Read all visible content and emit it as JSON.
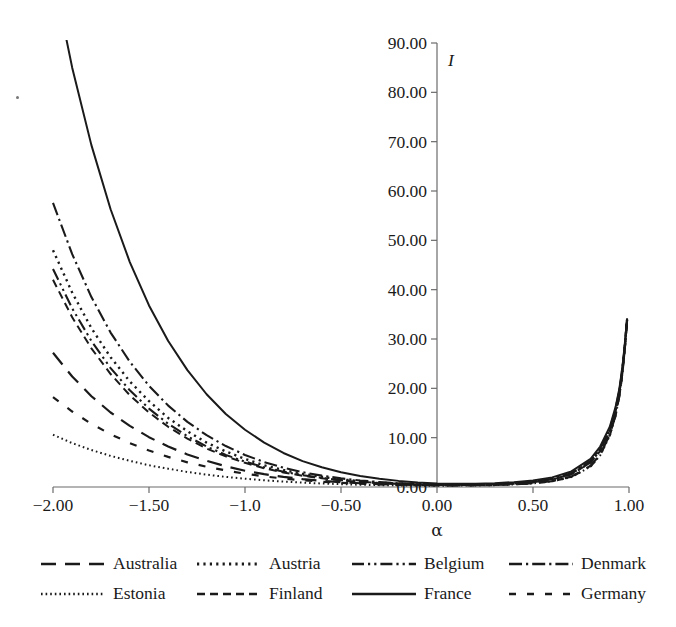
{
  "chart_data": {
    "type": "line",
    "title": "",
    "xlabel": "α",
    "ylabel": "I",
    "xlim": [
      -2.0,
      1.0
    ],
    "ylim": [
      0.0,
      90.0
    ],
    "grid": false,
    "legend_position": "bottom",
    "x_ticks": [
      {
        "value": -2.0,
        "label": "−2.00"
      },
      {
        "value": -1.5,
        "label": "−1.50"
      },
      {
        "value": -1.0,
        "label": "−1.0"
      },
      {
        "value": -0.5,
        "label": "−0.50"
      },
      {
        "value": 0.0,
        "label": "0.00"
      },
      {
        "value": 0.5,
        "label": "0.50"
      },
      {
        "value": 1.0,
        "label": "1.00"
      }
    ],
    "y_ticks": [
      {
        "value": 90.0,
        "label": "90.00"
      },
      {
        "value": 80.0,
        "label": "80.00"
      },
      {
        "value": 70.0,
        "label": "70.00"
      },
      {
        "value": 60.0,
        "label": "60.00"
      },
      {
        "value": 50.0,
        "label": "50.00"
      },
      {
        "value": 40.0,
        "label": "40.00"
      },
      {
        "value": 30.0,
        "label": "30.00"
      },
      {
        "value": 20.0,
        "label": "20.00"
      },
      {
        "value": 10.0,
        "label": "10.00"
      },
      {
        "value": 0.0,
        "label": "0.00"
      }
    ],
    "x": [
      -2.0,
      -1.9,
      -1.8,
      -1.7,
      -1.6,
      -1.5,
      -1.4,
      -1.3,
      -1.2,
      -1.1,
      -1.0,
      -0.9,
      -0.8,
      -0.7,
      -0.6,
      -0.5,
      -0.4,
      -0.3,
      -0.2,
      -0.1,
      0.0,
      0.1,
      0.2,
      0.3,
      0.4,
      0.5,
      0.6,
      0.7,
      0.8,
      0.85,
      0.9,
      0.93,
      0.95,
      0.96,
      0.97,
      0.98,
      0.985,
      0.99
    ],
    "series": [
      {
        "name": "Australia",
        "dash": "long-dash",
        "color": "#1a1a1a",
        "values": [
          27.2,
          22.4,
          18.4,
          15.1,
          12.4,
          10.1,
          8.2,
          6.6,
          5.3,
          4.2,
          3.3,
          2.6,
          2.05,
          1.6,
          1.25,
          0.98,
          0.76,
          0.6,
          0.47,
          0.39,
          0.35,
          0.34,
          0.36,
          0.42,
          0.55,
          0.78,
          1.2,
          2.1,
          4.3,
          6.6,
          10.6,
          14.6,
          18.6,
          21.4,
          24.8,
          29.0,
          31.4,
          33.8
        ]
      },
      {
        "name": "Austria",
        "dash": "dot",
        "color": "#1a1a1a",
        "values": [
          48.0,
          39.4,
          32.2,
          26.3,
          21.4,
          17.4,
          14.0,
          11.3,
          9.0,
          7.2,
          5.7,
          4.4,
          3.45,
          2.65,
          2.05,
          1.55,
          1.18,
          0.9,
          0.68,
          0.54,
          0.45,
          0.43,
          0.46,
          0.55,
          0.72,
          1.02,
          1.6,
          2.7,
          5.2,
          7.6,
          11.6,
          15.6,
          19.4,
          22.1,
          25.3,
          29.3,
          31.6,
          33.9
        ]
      },
      {
        "name": "Belgium",
        "dash": "dash-dot-dot",
        "color": "#1a1a1a",
        "values": [
          44.2,
          36.2,
          29.6,
          24.1,
          19.6,
          15.9,
          12.8,
          10.3,
          8.2,
          6.5,
          5.15,
          4.0,
          3.1,
          2.4,
          1.85,
          1.4,
          1.07,
          0.82,
          0.63,
          0.5,
          0.43,
          0.41,
          0.44,
          0.53,
          0.69,
          0.99,
          1.55,
          2.6,
          5.0,
          7.4,
          11.4,
          15.4,
          19.2,
          22.0,
          25.2,
          29.2,
          31.5,
          33.9
        ]
      },
      {
        "name": "Denmark",
        "dash": "dash-dot",
        "color": "#1a1a1a",
        "values": [
          57.6,
          47.2,
          38.5,
          31.3,
          25.4,
          20.5,
          16.5,
          13.2,
          10.5,
          8.3,
          6.5,
          5.05,
          3.9,
          3.0,
          2.3,
          1.75,
          1.32,
          1.0,
          0.76,
          0.59,
          0.49,
          0.46,
          0.49,
          0.58,
          0.76,
          1.07,
          1.67,
          2.8,
          5.3,
          7.8,
          11.8,
          15.8,
          19.6,
          22.3,
          25.4,
          29.4,
          31.7,
          34.0
        ]
      },
      {
        "name": "Estonia",
        "dash": "fine-dot",
        "color": "#1a1a1a",
        "values": [
          10.6,
          8.9,
          7.5,
          6.3,
          5.3,
          4.4,
          3.7,
          3.05,
          2.5,
          2.05,
          1.68,
          1.36,
          1.1,
          0.88,
          0.71,
          0.57,
          0.46,
          0.38,
          0.32,
          0.28,
          0.27,
          0.28,
          0.31,
          0.38,
          0.51,
          0.73,
          1.15,
          2.0,
          4.15,
          6.4,
          10.4,
          14.4,
          18.4,
          21.2,
          24.6,
          28.8,
          31.3,
          33.7
        ]
      },
      {
        "name": "Finland",
        "dash": "medium-dash",
        "color": "#1a1a1a",
        "values": [
          42.0,
          34.4,
          28.1,
          22.9,
          18.6,
          15.1,
          12.2,
          9.8,
          7.8,
          6.2,
          4.9,
          3.8,
          2.95,
          2.28,
          1.76,
          1.34,
          1.02,
          0.78,
          0.6,
          0.48,
          0.42,
          0.4,
          0.43,
          0.52,
          0.68,
          0.97,
          1.52,
          2.55,
          4.95,
          7.3,
          11.3,
          15.3,
          19.1,
          21.9,
          25.1,
          29.1,
          31.5,
          33.8
        ]
      },
      {
        "name": "France",
        "dash": "solid",
        "color": "#1a1a1a",
        "values": [
          104.0,
          85.0,
          69.3,
          56.3,
          45.6,
          36.8,
          29.6,
          23.7,
          18.8,
          14.8,
          11.6,
          9.0,
          6.9,
          5.25,
          4.0,
          3.0,
          2.25,
          1.67,
          1.24,
          0.93,
          0.73,
          0.66,
          0.68,
          0.78,
          0.98,
          1.32,
          1.95,
          3.15,
          5.7,
          8.2,
          12.2,
          16.2,
          20.0,
          22.7,
          25.8,
          29.8,
          32.0,
          34.2
        ]
      },
      {
        "name": "Germany",
        "dash": "spaced-dash",
        "color": "#1a1a1a",
        "values": [
          18.2,
          15.3,
          12.8,
          10.7,
          8.9,
          7.4,
          6.1,
          5.0,
          4.1,
          3.35,
          2.7,
          2.15,
          1.72,
          1.36,
          1.07,
          0.85,
          0.67,
          0.53,
          0.43,
          0.35,
          0.32,
          0.32,
          0.34,
          0.4,
          0.53,
          0.75,
          1.17,
          2.05,
          4.2,
          6.5,
          10.5,
          14.5,
          18.5,
          21.3,
          24.7,
          28.9,
          31.35,
          33.75
        ]
      }
    ]
  },
  "legend": {
    "rows": [
      [
        {
          "label": "Australia",
          "sample": "long-dash"
        },
        {
          "label": "Austria",
          "sample": "dot"
        },
        {
          "label": "Belgium",
          "sample": "dash-dot-dot"
        },
        {
          "label": "Denmark",
          "sample": "dash-dot"
        }
      ],
      [
        {
          "label": "Estonia",
          "sample": "fine-dot"
        },
        {
          "label": "Finland",
          "sample": "medium-dash"
        },
        {
          "label": "France",
          "sample": "solid"
        },
        {
          "label": "Germany",
          "sample": "spaced-dash"
        }
      ]
    ]
  }
}
